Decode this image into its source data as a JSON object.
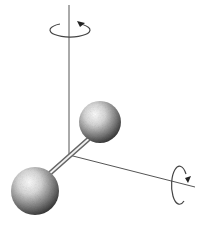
{
  "diagram": {
    "background": "#ffffff",
    "line_color": "#555555",
    "axes": {
      "vertical": {
        "x": 69,
        "y_top": 5,
        "y_bottom": 155
      },
      "horizontal": {
        "x_start": 69,
        "y_start": 155,
        "x_end": 195,
        "y_end": 187
      }
    },
    "rotation_arrows": [
      {
        "name": "vertical-axis-rotation",
        "cx": 69,
        "cy": 30,
        "rx": 20,
        "ry": 7
      },
      {
        "name": "horizontal-axis-rotation",
        "cx": 180,
        "cy": 187,
        "rx": 8,
        "ry": 19
      }
    ],
    "atoms": [
      {
        "name": "upper-atom",
        "cx": 100,
        "cy": 122,
        "r": 21
      },
      {
        "name": "lower-atom",
        "cx": 35,
        "cy": 191,
        "r": 24
      }
    ],
    "bond": {
      "x1": 92,
      "y1": 136,
      "x2": 48,
      "y2": 175
    }
  }
}
